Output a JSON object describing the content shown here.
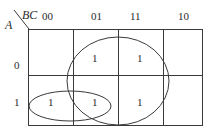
{
  "kmap": {
    "row_var": "A",
    "col_var": "BC",
    "col_labels": [
      "00",
      "01",
      "11",
      "10"
    ],
    "row_labels": [
      "0",
      "1"
    ],
    "cells": [
      [
        "",
        "1",
        "1",
        ""
      ],
      [
        "1",
        "1",
        "1",
        ""
      ]
    ],
    "groups": [
      {
        "name": "large-group",
        "cells": "A=0..1, BC=01..11"
      },
      {
        "name": "small-group",
        "cells": "A=1, BC=00..01"
      }
    ],
    "line_color": "#3a3a3a"
  }
}
